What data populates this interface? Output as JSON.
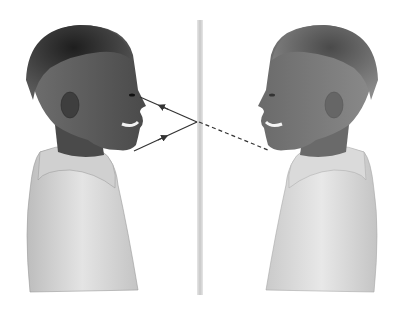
{
  "scene": {
    "width": 404,
    "height": 311,
    "background": "#ffffff",
    "description": "Boy facing a plane mirror with his reflection; light rays from chin reflect off mirror to eye",
    "mirror": {
      "x": 197,
      "y_top": 20,
      "y_bottom": 295,
      "width": 6,
      "color": "#d4d4d4"
    },
    "rays": {
      "color": "#333333",
      "incident": {
        "from": [
          134,
          151
        ],
        "to": [
          197,
          122
        ]
      },
      "reflected": {
        "from": [
          197,
          122
        ],
        "to": [
          140,
          97
        ]
      },
      "virtual": {
        "from": [
          199,
          122
        ],
        "to": [
          268,
          150
        ],
        "dashed": true
      }
    },
    "boy_real": {
      "facing": "right",
      "hair": "#2a2a2a",
      "skin": "#5a5a5a",
      "shirt": "#d8d8d8"
    },
    "boy_reflection": {
      "facing": "left",
      "hair": "#555555",
      "skin": "#7a7a7a",
      "shirt": "#e0e0e0"
    }
  }
}
